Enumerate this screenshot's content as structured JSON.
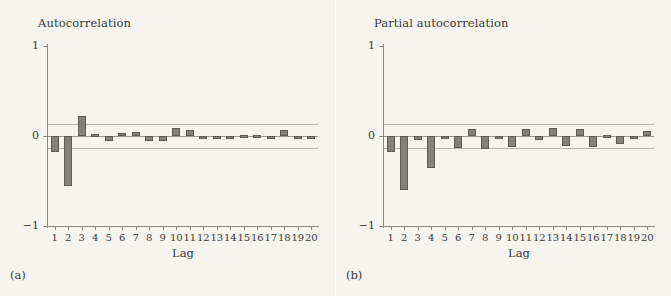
{
  "figure": {
    "background_color": "#f6f4ef",
    "bar_fill_color": "#82817e",
    "bar_edge_color": "#5c5b58",
    "axis_color": "#8a8a88",
    "ci_line_color": "#b4b4b0",
    "zero_line_color": "#9a9a98"
  },
  "panels": [
    {
      "caption": "(a)",
      "title": "Autocorrelation"
    },
    {
      "caption": "(b)",
      "title": "Partial autocorrelation"
    }
  ],
  "chart_data": [
    {
      "type": "bar",
      "title": "Autocorrelation",
      "xlabel": "Lag",
      "ylabel": "",
      "categories": [
        "1",
        "2",
        "3",
        "4",
        "5",
        "6",
        "7",
        "8",
        "9",
        "10",
        "11",
        "12",
        "13",
        "14",
        "15",
        "16",
        "17",
        "18",
        "19",
        "20"
      ],
      "values": [
        -0.18,
        -0.55,
        0.22,
        0.02,
        -0.05,
        0.03,
        0.04,
        -0.06,
        -0.05,
        0.09,
        0.07,
        -0.03,
        -0.02,
        -0.02,
        0.01,
        0.01,
        -0.02,
        0.07,
        -0.03,
        -0.02
      ],
      "ylim": [
        -1,
        1
      ],
      "yticks": [
        1,
        0,
        -1
      ],
      "ytick_labels": [
        "1",
        "0",
        "-1"
      ],
      "xticks": [
        1,
        2,
        3,
        4,
        5,
        6,
        7,
        8,
        9,
        10,
        11,
        12,
        13,
        14,
        15,
        16,
        17,
        18,
        19,
        20
      ],
      "confidence_bands": [
        0.13,
        -0.13
      ],
      "grid": false,
      "legend": "none"
    },
    {
      "type": "bar",
      "title": "Partial autocorrelation",
      "xlabel": "Lag",
      "ylabel": "",
      "categories": [
        "1",
        "2",
        "3",
        "4",
        "5",
        "6",
        "7",
        "8",
        "9",
        "10",
        "11",
        "12",
        "13",
        "14",
        "15",
        "16",
        "17",
        "18",
        "19",
        "20"
      ],
      "values": [
        -0.18,
        -0.6,
        -0.04,
        -0.35,
        -0.02,
        -0.13,
        0.08,
        -0.14,
        -0.03,
        -0.12,
        0.08,
        -0.04,
        0.09,
        -0.11,
        0.08,
        -0.12,
        0.01,
        -0.09,
        -0.02,
        0.06
      ],
      "ylim": [
        -1,
        1
      ],
      "yticks": [
        1,
        0,
        -1
      ],
      "ytick_labels": [
        "1",
        "0",
        "-1"
      ],
      "xticks": [
        1,
        2,
        3,
        4,
        5,
        6,
        7,
        8,
        9,
        10,
        11,
        12,
        13,
        14,
        15,
        16,
        17,
        18,
        19,
        20
      ],
      "confidence_bands": [
        0.13,
        -0.13
      ],
      "grid": false,
      "legend": "none"
    }
  ]
}
